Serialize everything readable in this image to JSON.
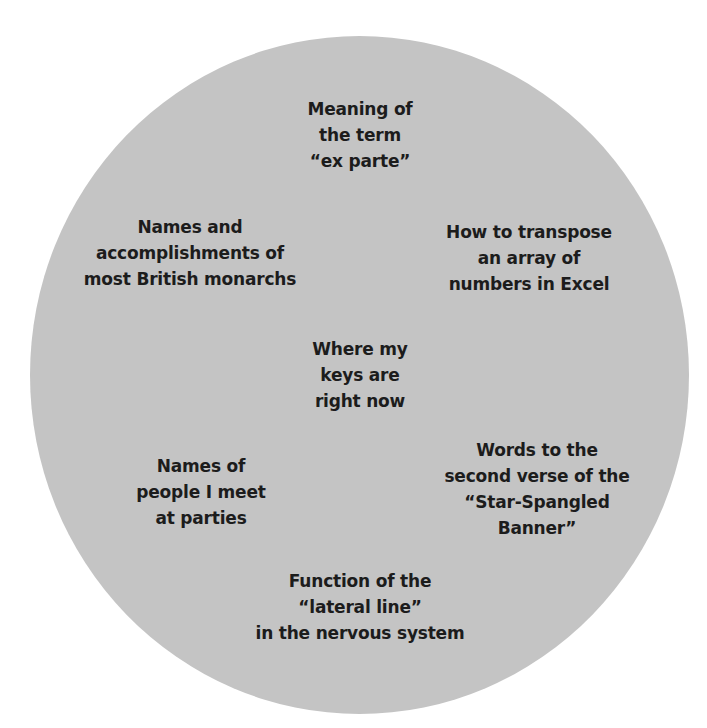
{
  "diagram": {
    "shape": "circle",
    "fill_color": "#c4c4c4",
    "text_color": "#1c1c1c",
    "items": [
      {
        "id": "ex-parte",
        "lines": [
          "Meaning of",
          "the term",
          "“ex parte”"
        ]
      },
      {
        "id": "british-monarchs",
        "lines": [
          "Names and",
          "accomplishments of",
          "most British monarchs"
        ]
      },
      {
        "id": "excel-transpose",
        "lines": [
          "How to transpose",
          "an array of",
          "numbers in Excel"
        ]
      },
      {
        "id": "keys",
        "lines": [
          "Where my",
          "keys are",
          "right now"
        ]
      },
      {
        "id": "names-at-parties",
        "lines": [
          "Names of",
          "people I meet",
          "at parties"
        ]
      },
      {
        "id": "star-spangled-banner",
        "lines": [
          "Words to the",
          "second verse of the",
          "“Star-Spangled",
          "Banner”"
        ]
      },
      {
        "id": "lateral-line",
        "lines": [
          "Function of the",
          "“lateral line”",
          "in the nervous system"
        ]
      }
    ]
  }
}
